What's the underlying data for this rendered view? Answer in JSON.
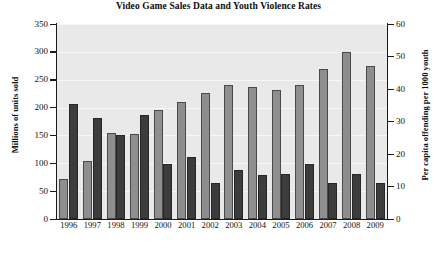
{
  "chart_data": {
    "type": "bar",
    "title": "Video Game Sales Data and Youth Violence Rates",
    "xlabel": "",
    "ylabel": "Millions of units sold",
    "ylabel_right": "Per capita offending per 1000 youth",
    "ylim": [
      0,
      350
    ],
    "ylim_right": [
      0,
      60
    ],
    "yticks": [
      0,
      50,
      100,
      150,
      200,
      250,
      300,
      350
    ],
    "yticks_right": [
      0,
      10,
      20,
      30,
      40,
      50,
      60
    ],
    "grid": true,
    "legend": "none",
    "categories": [
      "1996",
      "1997",
      "1998",
      "1999",
      "2000",
      "2001",
      "2002",
      "2003",
      "2004",
      "2005",
      "2006",
      "2007",
      "2008",
      "2009"
    ],
    "series": [
      {
        "name": "Millions of units sold",
        "axis": "left",
        "color": "#8e8e8e",
        "values": [
          72,
          105,
          155,
          152,
          196,
          210,
          227,
          241,
          237,
          231,
          241,
          269,
          300,
          275
        ]
      },
      {
        "name": "Per capita offending per 1000 youth",
        "axis": "right",
        "color": "#3c3c3c",
        "values": [
          35.5,
          31.0,
          26.0,
          32.0,
          17.0,
          19.0,
          11.0,
          15.0,
          13.5,
          14.0,
          17.0,
          11.0,
          14.0,
          11.0
        ]
      }
    ]
  },
  "caption": {
    "fragment": ""
  }
}
